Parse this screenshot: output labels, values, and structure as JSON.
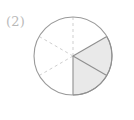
{
  "figure": {
    "label": "(2)",
    "label_color": "#b9b9b9",
    "background_color": "#ffffff"
  },
  "diagram": {
    "kind": "fraction-circle",
    "center_x": 73,
    "center_y": 56,
    "radius": 39,
    "total_sectors": 6,
    "shaded_sectors": 2,
    "sector_angle_degrees": 60,
    "fraction_text": "2/6",
    "outline_color": "#9a9a9a",
    "outline_width": 1.1,
    "divider_dashed_color": "#cfcfcf",
    "divider_solid_color": "#8f8f8f",
    "shade_fill_color": "#e9e9e9",
    "dash_pattern": "3 3"
  },
  "chart_data": {
    "type": "pie",
    "title": "(2)",
    "categories": [
      "shaded",
      "unshaded"
    ],
    "values": [
      2,
      4
    ],
    "slice_labels": [
      "shaded sector 1",
      "shaded sector 2",
      "unshaded sector 1",
      "unshaded sector 2",
      "unshaded sector 3",
      "unshaded sector 4"
    ],
    "slice_values": [
      1,
      1,
      1,
      1,
      1,
      1
    ],
    "slice_shaded": [
      true,
      true,
      false,
      false,
      false,
      false
    ],
    "slice_start_angles_deg": [
      -30,
      30,
      90,
      150,
      210,
      270
    ],
    "slice_end_angles_deg": [
      30,
      90,
      150,
      210,
      270,
      330
    ],
    "colors": [
      "#e9e9e9",
      "#ffffff"
    ],
    "legend": [],
    "xlabel": "",
    "ylabel": "",
    "grid": false,
    "legend_position": "none",
    "annotations": [
      "(2)"
    ]
  },
  "sectors": [
    {
      "name": "sector-shaded-upper-right",
      "start_deg": -30,
      "end_deg": 30,
      "shaded": true
    },
    {
      "name": "sector-shaded-lower-right",
      "start_deg": 30,
      "end_deg": 90,
      "shaded": true
    },
    {
      "name": "sector-lower-middle",
      "start_deg": 90,
      "end_deg": 150,
      "shaded": false
    },
    {
      "name": "sector-lower-left",
      "start_deg": 150,
      "end_deg": 210,
      "shaded": false
    },
    {
      "name": "sector-upper-left",
      "start_deg": 210,
      "end_deg": 270,
      "shaded": false
    },
    {
      "name": "sector-upper-middle",
      "start_deg": 270,
      "end_deg": 330,
      "shaded": false
    }
  ]
}
